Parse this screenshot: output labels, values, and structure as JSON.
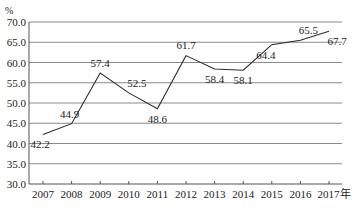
{
  "chart_data": {
    "type": "line",
    "title": "",
    "xlabel": "年",
    "ylabel": "%",
    "categories": [
      "2007",
      "2008",
      "2009",
      "2010",
      "2011",
      "2012",
      "2013",
      "2014",
      "2015",
      "2016",
      "2017"
    ],
    "x_suffix_last": "年",
    "series": [
      {
        "name": "",
        "values": [
          42.2,
          44.9,
          57.4,
          52.5,
          48.6,
          61.7,
          58.4,
          58.1,
          64.4,
          65.5,
          67.7
        ]
      }
    ],
    "ylim": [
      30.0,
      70.0
    ],
    "yticks": [
      "30.0",
      "35.0",
      "40.0",
      "45.0",
      "50.0",
      "55.0",
      "60.0",
      "65.0",
      "70.0"
    ],
    "grid": true,
    "legend": "none",
    "data_labels": true
  },
  "colors": {
    "line": "#2a2a2a",
    "grid": "#8a8a8a",
    "axis": "#555555",
    "text": "#222222"
  },
  "labels": {
    "y_unit": "%"
  }
}
